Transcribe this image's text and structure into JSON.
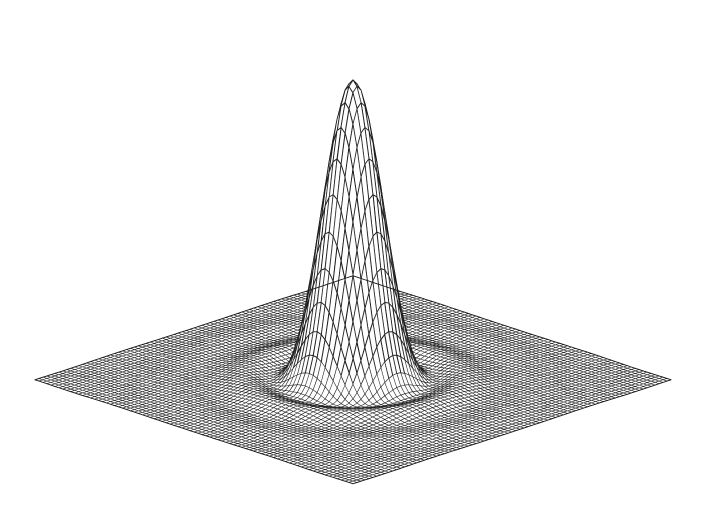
{
  "figure": {
    "title": "",
    "subtitle": "",
    "caption": "",
    "width_px": 702,
    "height_px": 521,
    "background_color": "#ffffff",
    "line_color": "#1a1a1a",
    "fill_color": "#ffffff",
    "has_axes": false,
    "has_axis_labels": false,
    "has_tick_labels": false,
    "has_legend": false,
    "has_grid_box": false,
    "has_text": false,
    "render_style": "hidden-line-removed-wireframe",
    "media": "scanned-halftone-print"
  },
  "chart_data": {
    "type": "surface",
    "render": "wireframe-mesh",
    "title": "",
    "subtitle": "",
    "xlabel": "",
    "ylabel": "",
    "zlabel": "",
    "function": "airy-diffraction-pattern",
    "function_expression": "z = (2*J1(k*r)/(k*r))^2",
    "grid_nx": 81,
    "grid_ny": 81,
    "xlim": [
      -10.5,
      10.5
    ],
    "ylim": [
      -10.5,
      10.5
    ],
    "zlim": [
      0,
      1
    ],
    "peak_value": 1.0,
    "peak_location": [
      0,
      0
    ],
    "ring_count": 4,
    "ring_peak_values": [
      0.0175,
      0.0042,
      0.0016,
      0.0008
    ],
    "ring_radii": [
      5.14,
      8.42,
      11.62,
      14.8
    ],
    "zero_radii": [
      3.83,
      7.02,
      10.17,
      13.32
    ],
    "grid": true,
    "legend": false,
    "legend_position": "none",
    "projection": {
      "type": "oblique-perspective",
      "azimuth_deg": 45,
      "elevation_deg": 22,
      "z_exaggeration": 1.0
    }
  },
  "geometry": {
    "base_left_corner": [
      35,
      356
    ],
    "base_right_corner": [
      675,
      355
    ],
    "base_front_corner": [
      348,
      497
    ],
    "base_back_corner": [
      350,
      288
    ],
    "peak_apex": [
      348,
      34
    ],
    "peak_base_half_width": 40,
    "plot_center": [
      353,
      380
    ],
    "half_width_x": 318,
    "half_width_y": 104,
    "z_scale_px": 300
  },
  "style": {
    "line_width": 0.55,
    "peak_line_width": 0.9,
    "opacity": 1.0,
    "hidden_line_removal": true,
    "fill_polygons": true,
    "noise_amount": 0.22,
    "ink_jitter": 0.35
  },
  "accessibility": {
    "alt_text": "Black and white wireframe mesh plot of a two-dimensional Airy diffraction pattern: a very tall, narrow central spike rising from a square mesh surface that is covered with concentric decaying ripple rings."
  }
}
